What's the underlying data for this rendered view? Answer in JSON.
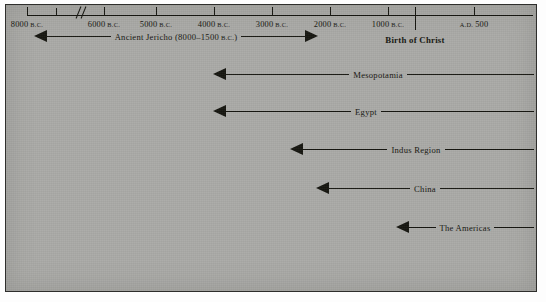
{
  "figure": {
    "kind": "historical-timeline-chart",
    "background_color": "#a9a9a6",
    "ink_color": "#15150f"
  },
  "chart_data": {
    "type": "bar",
    "title": "",
    "xlabel": "",
    "ylabel": "",
    "orientation": "horizontal",
    "axis": {
      "label_suffix_bc": "B.C.",
      "label_prefix_ad": "A.D.",
      "has_scale_break": true,
      "scale_break_between": [
        "8000 B.C.",
        "6000 B.C."
      ],
      "grid": false,
      "legend": "none",
      "ticks": [
        {
          "label_main": "8000",
          "label_small": "B.C.",
          "x": 21
        },
        {
          "label_main": "",
          "label_small": "",
          "x": 50
        },
        {
          "label_main": "6000",
          "label_small": "B.C.",
          "x": 98
        },
        {
          "label_main": "5000",
          "label_small": "B.C.",
          "x": 150
        },
        {
          "label_main": "4000",
          "label_small": "B.C.",
          "x": 208
        },
        {
          "label_main": "3000",
          "label_small": "B.C.",
          "x": 266
        },
        {
          "label_main": "2000",
          "label_small": "B.C.",
          "x": 324
        },
        {
          "label_main": "1000",
          "label_small": "B.C.",
          "x": 382
        },
        {
          "label_main": "500",
          "label_small": "A.D.",
          "x": 468
        }
      ],
      "break_x": 72,
      "christ_marker": {
        "label": "Birth of Christ",
        "x": 409
      }
    },
    "categories": [
      "Ancient Jericho (8000–1500 B.C.)",
      "Mesopotamia",
      "Egypt",
      "Indus Region",
      "China",
      "The Americas"
    ],
    "bars": [
      {
        "label": "Ancient Jericho (8000–1500",
        "label_small": "B.C.",
        "label_tail": ")",
        "start_x": 28,
        "end_x": 312,
        "y": 24,
        "arrow_left": true,
        "arrow_right": true,
        "label_center_x": 170,
        "span": "8000–1500 B.C."
      },
      {
        "label": "Mesopotamia",
        "label_small": "",
        "label_tail": "",
        "start_x": 207,
        "end_x": 528,
        "y": 62,
        "arrow_left": true,
        "arrow_right": false,
        "label_center_x": 372,
        "span": ""
      },
      {
        "label": "Egypt",
        "label_small": "",
        "label_tail": "",
        "start_x": 207,
        "end_x": 528,
        "y": 99,
        "arrow_left": true,
        "arrow_right": false,
        "label_center_x": 360,
        "span": ""
      },
      {
        "label": "Indus Region",
        "label_small": "",
        "label_tail": "",
        "start_x": 284,
        "end_x": 528,
        "y": 137,
        "arrow_left": true,
        "arrow_right": false,
        "label_center_x": 410,
        "span": ""
      },
      {
        "label": "China",
        "label_small": "",
        "label_tail": "",
        "start_x": 310,
        "end_x": 528,
        "y": 176,
        "arrow_left": true,
        "arrow_right": false,
        "label_center_x": 419,
        "span": ""
      },
      {
        "label": "The Americas",
        "label_small": "",
        "label_tail": "",
        "start_x": 390,
        "end_x": 528,
        "y": 215,
        "arrow_left": true,
        "arrow_right": false,
        "label_center_x": 459,
        "span": ""
      }
    ]
  }
}
